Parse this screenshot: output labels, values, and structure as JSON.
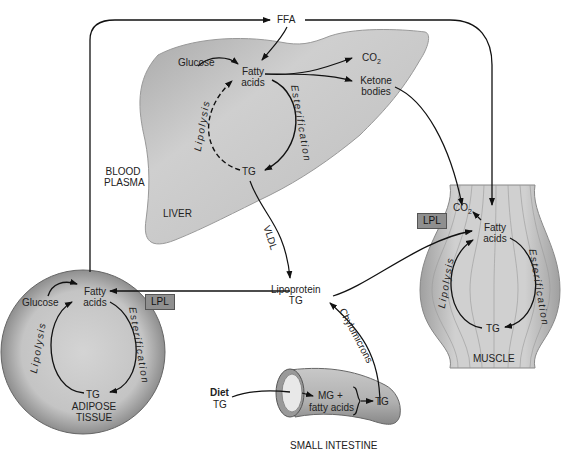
{
  "regions": {
    "blood_plasma": "BLOOD PLASMA",
    "liver": "LIVER",
    "adipose": "ADIPOSE TISSUE",
    "muscle": "MUSCLE",
    "small_intestine": "SMALL INTESTINE"
  },
  "top": {
    "ffa": "FFA"
  },
  "liver": {
    "glucose": "Glucose",
    "fatty_acids": "Fatty acids",
    "co2": "CO",
    "co2_sub": "2",
    "ketone": "Ketone bodies",
    "tg": "TG",
    "lipolysis": "Lipolysis",
    "esterification": "Esterification"
  },
  "vldl": "VLDL",
  "lipoprotein": {
    "line1": "Lipoprotein",
    "line2": "TG"
  },
  "chylomicrons": "Chylomicrons",
  "adipose": {
    "glucose": "Glucose",
    "fatty_acids": "Fatty acids",
    "tg": "TG",
    "lipolysis": "Lipolysis",
    "esterification": "Esterification",
    "lpl": "LPL"
  },
  "muscle": {
    "co2": "CO",
    "co2_sub": "2",
    "fatty_acids": "Fatty acids",
    "tg": "TG",
    "lipolysis": "Lipolysis",
    "esterification": "Esterification",
    "lpl": "LPL"
  },
  "intestine": {
    "diet": "Diet",
    "diet_tg": "TG",
    "mg": "MG +",
    "fatty_acids": "fatty acids",
    "tg": "TG"
  },
  "colors": {
    "tissue_fill": "#b8b8b8",
    "tissue_light": "#d6d6d6",
    "lpl_box": "#8f8f8f",
    "line": "#111111"
  }
}
